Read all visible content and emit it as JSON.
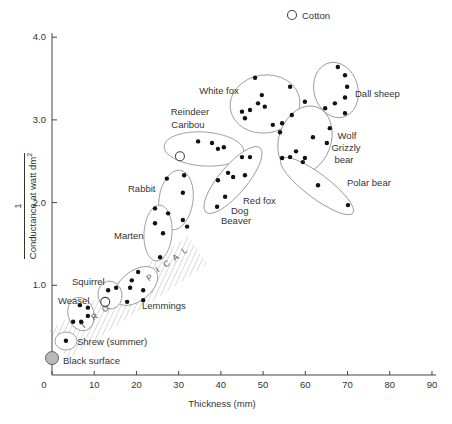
{
  "figure": {
    "width": 452,
    "height": 424,
    "background": "#ffffff"
  },
  "legend": {
    "symbol": "open-circle",
    "label": "Cotton",
    "cx": 292,
    "cy": 15,
    "r": 4.5
  },
  "axes": {
    "x": {
      "title": "Thickness (mm)",
      "ticks": [
        0,
        10,
        20,
        30,
        40,
        50,
        60,
        70,
        80,
        90
      ],
      "title_x": 222,
      "title_y": 407
    },
    "y": {
      "numerator": "1",
      "denominator": "Conductance at watt dm",
      "denominator_sup": "2",
      "ticks": [
        {
          "v": 1,
          "label": "1.0"
        },
        {
          "v": 2,
          "label": "2.0"
        },
        {
          "v": 3,
          "label": "3.0"
        },
        {
          "v": 4,
          "label": "4.0"
        }
      ]
    }
  },
  "chart_data": {
    "type": "scatter",
    "title": "",
    "xlabel": "Thickness (mm)",
    "ylabel": "1 / Conductance at watt dm2",
    "xlim": [
      0,
      90
    ],
    "ylim": [
      0,
      4.0
    ],
    "grid": false,
    "px": {
      "x0": 52,
      "sx": 4.222,
      "y0": 368,
      "sy": 82.7,
      "axis_bottom": 375,
      "axis_left": 52,
      "axis_top": 33,
      "axis_right": 436,
      "tick0_x": 44,
      "tick_label_y": 388
    },
    "band": {
      "word": "TROPICAL",
      "polygon": "48.5,330.9 188.5,235.9 207.5,264.1 67.5,359.1",
      "rotation": -34,
      "letters": [
        {
          "ch": "T",
          "x": 85,
          "y": 328
        },
        {
          "ch": "R",
          "x": 96,
          "y": 319
        },
        {
          "ch": "O",
          "x": 107,
          "y": 311
        },
        {
          "ch": "P",
          "x": 151,
          "y": 280
        },
        {
          "ch": "I",
          "x": 159,
          "y": 272
        },
        {
          "ch": "C",
          "x": 168,
          "y": 266
        },
        {
          "ch": "A",
          "x": 177,
          "y": 260
        },
        {
          "ch": "L",
          "x": 186,
          "y": 253
        }
      ]
    },
    "groups": [
      {
        "name": "white-fox",
        "labels": [
          {
            "text": "White fox",
            "x": 219,
            "y": 94,
            "anchor": "middle"
          }
        ],
        "outline": {
          "cx": 265,
          "cy": 104,
          "rx": 35,
          "ry": 29,
          "angle": -8
        },
        "points": [
          [
            48.1,
            3.51
          ],
          [
            56.4,
            3.4
          ],
          [
            49.7,
            3.3
          ],
          [
            48.8,
            3.2
          ],
          [
            50.4,
            3.16
          ],
          [
            46.9,
            3.12
          ],
          [
            45.0,
            3.1
          ],
          [
            45.7,
            3.02
          ],
          [
            52.3,
            2.94
          ],
          [
            54.5,
            2.96
          ],
          [
            56.8,
            3.06
          ],
          [
            54.0,
            2.85
          ]
        ]
      },
      {
        "name": "dall-sheep",
        "labels": [
          {
            "text": "Dall sheep",
            "x": 355,
            "y": 97,
            "anchor": "start"
          }
        ],
        "outline": {
          "cx": 336,
          "cy": 90,
          "rx": 22,
          "ry": 28,
          "angle": -15
        },
        "points": [
          [
            67.7,
            3.64
          ],
          [
            69.4,
            3.54
          ],
          [
            69.9,
            3.4
          ],
          [
            59.9,
            3.22
          ],
          [
            69.4,
            3.27
          ],
          [
            67.0,
            3.2
          ],
          [
            64.7,
            3.14
          ],
          [
            69.4,
            3.08
          ]
        ]
      },
      {
        "name": "wolf-grizzly-bear",
        "labels": [
          {
            "text": "Wolf",
            "x": 347,
            "y": 139,
            "anchor": "middle"
          },
          {
            "text": "Grizzly",
            "x": 346,
            "y": 151,
            "anchor": "middle"
          },
          {
            "text": "bear",
            "x": 344,
            "y": 163,
            "anchor": "middle"
          }
        ],
        "outline": {
          "cx": 305,
          "cy": 140,
          "rx": 26,
          "ry": 35,
          "angle": 20
        },
        "points": [
          [
            65.8,
            2.9
          ],
          [
            61.8,
            2.79
          ],
          [
            65.1,
            2.72
          ],
          [
            57.8,
            2.62
          ],
          [
            59.9,
            2.54
          ],
          [
            54.5,
            2.54
          ],
          [
            56.4,
            2.55
          ],
          [
            59.4,
            2.49
          ]
        ]
      },
      {
        "name": "polar-bear",
        "labels": [
          {
            "text": "Polar bear",
            "x": 347,
            "y": 186,
            "anchor": "start"
          }
        ],
        "outline": {
          "cx": 317,
          "cy": 186,
          "rx": 45,
          "ry": 12,
          "angle": 37
        },
        "points": [
          [
            63.0,
            2.21
          ],
          [
            70.1,
            1.97
          ]
        ]
      },
      {
        "name": "reindeer-caribou",
        "labels": [
          {
            "text": "Reindeer",
            "x": 190,
            "y": 115,
            "anchor": "middle"
          },
          {
            "text": "Caribou",
            "x": 188,
            "y": 128,
            "anchor": "middle"
          }
        ],
        "outline": {
          "cx": 204,
          "cy": 149,
          "rx": 40,
          "ry": 17,
          "angle": 4
        },
        "points": [
          [
            34.6,
            2.74
          ],
          [
            37.9,
            2.72
          ],
          [
            39.3,
            2.65
          ],
          [
            40.7,
            2.67
          ]
        ],
        "open_points": [
          [
            30.3,
            2.56
          ]
        ]
      },
      {
        "name": "red-fox-dog-beaver",
        "labels": [
          {
            "text": "Red fox",
            "x": 243,
            "y": 204,
            "anchor": "start"
          },
          {
            "text": "Dog",
            "x": 231,
            "y": 214,
            "anchor": "start"
          },
          {
            "text": "Beaver",
            "x": 221,
            "y": 224,
            "anchor": "start"
          }
        ],
        "outline": {
          "cx": 233,
          "cy": 180,
          "rx": 42,
          "ry": 14,
          "angle": -50
        },
        "points": [
          [
            45.0,
            2.55
          ],
          [
            46.9,
            2.55
          ],
          [
            41.7,
            2.36
          ],
          [
            42.9,
            2.31
          ],
          [
            45.7,
            2.33
          ],
          [
            39.3,
            2.27
          ],
          [
            41.0,
            2.07
          ],
          [
            39.1,
            1.95
          ]
        ]
      },
      {
        "name": "rabbit",
        "labels": [
          {
            "text": "Rabbit",
            "x": 128,
            "y": 192,
            "anchor": "start"
          }
        ],
        "outline": {
          "cx": 176,
          "cy": 200,
          "rx": 17,
          "ry": 30,
          "angle": 8
        },
        "points": [
          [
            27.2,
            2.29
          ],
          [
            31.3,
            2.33
          ],
          [
            31.0,
            2.12
          ],
          [
            27.5,
            1.87
          ],
          [
            31.0,
            1.79
          ],
          [
            32.0,
            1.71
          ]
        ]
      },
      {
        "name": "marten",
        "labels": [
          {
            "text": "Marten",
            "x": 114,
            "y": 239,
            "anchor": "start"
          }
        ],
        "outline": {
          "cx": 158,
          "cy": 233,
          "rx": 14,
          "ry": 28,
          "angle": 4
        },
        "points": [
          [
            24.4,
            1.93
          ],
          [
            24.4,
            1.75
          ],
          [
            26.3,
            1.63
          ],
          [
            25.6,
            1.34
          ]
        ]
      },
      {
        "name": "lemmings",
        "labels": [
          {
            "text": "Lemmings",
            "x": 142,
            "y": 309,
            "anchor": "start"
          }
        ],
        "outline": {
          "cx": 136,
          "cy": 286,
          "rx": 25,
          "ry": 15,
          "angle": -38
        },
        "points": [
          [
            20.4,
            1.16
          ],
          [
            18.9,
            1.06
          ],
          [
            18.5,
            0.97
          ],
          [
            21.6,
            0.94
          ],
          [
            17.8,
            0.8
          ],
          [
            21.6,
            0.82
          ]
        ]
      },
      {
        "name": "squirrel",
        "labels": [
          {
            "text": "Squirrel",
            "x": 72,
            "y": 285,
            "anchor": "start"
          }
        ],
        "outline": {
          "cx": 110,
          "cy": 295,
          "rx": 12,
          "ry": 14,
          "angle": -10
        },
        "points": [
          [
            13.3,
            0.94
          ],
          [
            15.2,
            0.97
          ]
        ],
        "open_points": [
          [
            12.6,
            0.8
          ]
        ]
      },
      {
        "name": "weasel",
        "labels": [
          {
            "text": "Weasel",
            "x": 58,
            "y": 304,
            "anchor": "start"
          }
        ],
        "outline": {
          "cx": 81,
          "cy": 314,
          "rx": 13,
          "ry": 17,
          "angle": -15
        },
        "points": [
          [
            6.6,
            0.76
          ],
          [
            8.5,
            0.73
          ],
          [
            8.5,
            0.63
          ],
          [
            5.0,
            0.56
          ],
          [
            6.9,
            0.56
          ]
        ]
      },
      {
        "name": "shrew-summer",
        "labels": [
          {
            "text": "Shrew (summer)",
            "x": 77,
            "y": 345,
            "anchor": "start"
          }
        ],
        "outline": {
          "cx": 66,
          "cy": 341,
          "rx": 11,
          "ry": 9,
          "angle": 0
        },
        "points": [
          [
            3.3,
            0.33
          ]
        ]
      }
    ],
    "special_points": [
      {
        "name": "black-surface",
        "label": "Black surface",
        "label_x": 63,
        "label_y": 364,
        "point": [
          0,
          0.12
        ],
        "fill": "#b9b9b9",
        "r": 6.5
      }
    ],
    "colors": {
      "dot": "#111111",
      "outline": "#999999",
      "hatch": "#999999",
      "axis": "#444444",
      "text": "#333333"
    }
  }
}
